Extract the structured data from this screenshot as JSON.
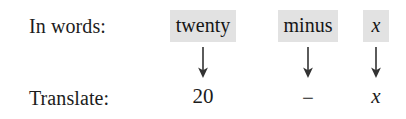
{
  "figure": {
    "name": "word-to-math-translation",
    "rows": {
      "words_label": "In words:",
      "translate_label": "Translate:"
    },
    "colors": {
      "page_background": "#ffffff",
      "highlight": "#e2e2e2",
      "text": "#1c1c1c",
      "arrow": "#333333"
    },
    "columns": [
      {
        "key": "twenty",
        "word": "twenty",
        "word_italic": false,
        "arrow": "down-arrow",
        "value": "20",
        "value_italic": false,
        "value_kind": "number"
      },
      {
        "key": "minus",
        "word": "minus",
        "word_italic": false,
        "arrow": "down-arrow",
        "value": "−",
        "value_italic": false,
        "value_kind": "operator"
      },
      {
        "key": "x",
        "word": "x",
        "word_italic": true,
        "arrow": "down-arrow",
        "value": "x",
        "value_italic": true,
        "value_kind": "variable"
      }
    ]
  }
}
